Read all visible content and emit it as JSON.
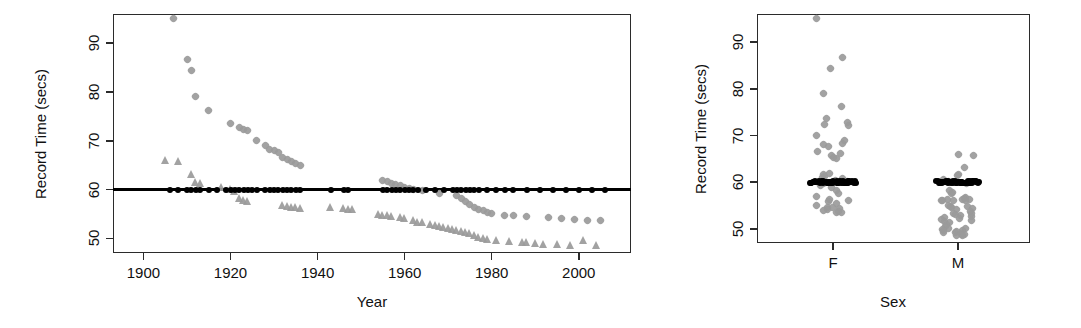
{
  "figure": {
    "background": "#ffffff",
    "female_color": "#9a9a9a",
    "male_color": "#9a9a9a",
    "record_color": "#000000"
  },
  "panels": {
    "left": {
      "name": "record-time-vs-year",
      "ylabel": "Record Time (secs)",
      "xlabel": "Year",
      "yticks": [
        "50",
        "60",
        "70",
        "80",
        "90"
      ],
      "xticks": [
        "1900",
        "1920",
        "1940",
        "1960",
        "1980",
        "2000"
      ]
    },
    "right": {
      "name": "record-time-by-sex",
      "ylabel": "Record Time (secs)",
      "xlabel": "Sex",
      "yticks": [
        "50",
        "60",
        "70",
        "80",
        "90"
      ],
      "xticks": [
        "F",
        "M"
      ]
    }
  },
  "chart_data": [
    {
      "type": "scatter",
      "id": "record-time-vs-year",
      "title": "",
      "xlabel": "Year",
      "ylabel": "Record Time (secs)",
      "xlim": [
        1893,
        2012
      ],
      "ylim": [
        47,
        96
      ],
      "xticks": [
        1900,
        1920,
        1940,
        1960,
        1980,
        2000
      ],
      "yticks": [
        50,
        60,
        70,
        80,
        90
      ],
      "grid": false,
      "legend": null,
      "annotations": [
        {
          "kind": "hline",
          "y": 60,
          "color": "#000000",
          "label": "60 second reference line"
        }
      ],
      "series": [
        {
          "name": "Female record time",
          "marker": "diamond",
          "color": "#9a9a9a",
          "points": [
            [
              1907,
              95.0
            ],
            [
              1910,
              86.6
            ],
            [
              1911,
              84.4
            ],
            [
              1912,
              79.0
            ],
            [
              1915,
              76.2
            ],
            [
              1920,
              73.6
            ],
            [
              1922,
              72.8
            ],
            [
              1923,
              72.4
            ],
            [
              1924,
              72.2
            ],
            [
              1926,
              70.0
            ],
            [
              1928,
              69.0
            ],
            [
              1929,
              68.2
            ],
            [
              1930,
              68.0
            ],
            [
              1931,
              67.6
            ],
            [
              1932,
              66.6
            ],
            [
              1933,
              66.2
            ],
            [
              1934,
              65.8
            ],
            [
              1935,
              65.4
            ],
            [
              1936,
              65.0
            ],
            [
              1955,
              61.8
            ],
            [
              1956,
              61.6
            ],
            [
              1957,
              61.2
            ],
            [
              1958,
              61.0
            ],
            [
              1959,
              60.8
            ],
            [
              1960,
              60.4
            ],
            [
              1961,
              60.2
            ],
            [
              1962,
              60.0
            ],
            [
              1964,
              59.8
            ],
            [
              1968,
              59.2
            ],
            [
              1972,
              58.8
            ],
            [
              1973,
              58.2
            ],
            [
              1974,
              57.6
            ],
            [
              1975,
              57.0
            ],
            [
              1976,
              56.4
            ],
            [
              1977,
              56.0
            ],
            [
              1978,
              55.8
            ],
            [
              1979,
              55.4
            ],
            [
              1980,
              55.0
            ],
            [
              1983,
              54.6
            ],
            [
              1985,
              54.6
            ],
            [
              1988,
              54.4
            ],
            [
              1993,
              54.2
            ],
            [
              1996,
              54.0
            ],
            [
              1999,
              53.8
            ],
            [
              2002,
              53.6
            ],
            [
              2005,
              53.6
            ]
          ]
        },
        {
          "name": "Male record time",
          "marker": "triangle",
          "color": "#9a9a9a",
          "points": [
            [
              1905,
              66.0
            ],
            [
              1908,
              65.8
            ],
            [
              1911,
              63.2
            ],
            [
              1912,
              61.6
            ],
            [
              1913,
              61.4
            ],
            [
              1918,
              60.6
            ],
            [
              1920,
              60.2
            ],
            [
              1921,
              59.8
            ],
            [
              1922,
              58.2
            ],
            [
              1923,
              57.8
            ],
            [
              1924,
              57.6
            ],
            [
              1932,
              56.8
            ],
            [
              1933,
              56.6
            ],
            [
              1934,
              56.4
            ],
            [
              1935,
              56.4
            ],
            [
              1936,
              56.2
            ],
            [
              1943,
              56.4
            ],
            [
              1946,
              56.2
            ],
            [
              1947,
              56.0
            ],
            [
              1948,
              56.0
            ],
            [
              1954,
              55.0
            ],
            [
              1955,
              54.8
            ],
            [
              1956,
              54.8
            ],
            [
              1957,
              54.6
            ],
            [
              1959,
              54.4
            ],
            [
              1960,
              54.2
            ],
            [
              1962,
              53.8
            ],
            [
              1963,
              53.4
            ],
            [
              1964,
              53.4
            ],
            [
              1966,
              53.0
            ],
            [
              1967,
              52.8
            ],
            [
              1968,
              52.6
            ],
            [
              1969,
              52.4
            ],
            [
              1970,
              52.2
            ],
            [
              1971,
              52.0
            ],
            [
              1972,
              51.8
            ],
            [
              1973,
              51.6
            ],
            [
              1974,
              51.4
            ],
            [
              1975,
              51.0
            ],
            [
              1976,
              50.6
            ],
            [
              1977,
              50.2
            ],
            [
              1978,
              50.0
            ],
            [
              1979,
              49.8
            ],
            [
              1981,
              49.6
            ],
            [
              1984,
              49.4
            ],
            [
              1987,
              49.2
            ],
            [
              1988,
              49.2
            ],
            [
              1990,
              49.0
            ],
            [
              1992,
              48.8
            ],
            [
              1995,
              48.8
            ],
            [
              1998,
              48.6
            ],
            [
              2001,
              49.6
            ],
            [
              2004,
              48.6
            ]
          ]
        },
        {
          "name": "Records at 60 seconds",
          "marker": "filled-circle",
          "color": "#000000",
          "points": [
            [
              1906,
              60
            ],
            [
              1908,
              60
            ],
            [
              1910,
              60
            ],
            [
              1911,
              60
            ],
            [
              1912,
              60
            ],
            [
              1913,
              60
            ],
            [
              1915,
              60
            ],
            [
              1917,
              60
            ],
            [
              1919,
              60
            ],
            [
              1920,
              60
            ],
            [
              1921,
              60
            ],
            [
              1922,
              60
            ],
            [
              1923,
              60
            ],
            [
              1924,
              60
            ],
            [
              1925,
              60
            ],
            [
              1926,
              60
            ],
            [
              1928,
              60
            ],
            [
              1929,
              60
            ],
            [
              1930,
              60
            ],
            [
              1931,
              60
            ],
            [
              1932,
              60
            ],
            [
              1933,
              60
            ],
            [
              1934,
              60
            ],
            [
              1935,
              60
            ],
            [
              1936,
              60
            ],
            [
              1943,
              60
            ],
            [
              1946,
              60
            ],
            [
              1947,
              60
            ],
            [
              1955,
              60
            ],
            [
              1956,
              60
            ],
            [
              1957,
              60
            ],
            [
              1958,
              60
            ],
            [
              1959,
              60
            ],
            [
              1960,
              60
            ],
            [
              1961,
              60
            ],
            [
              1962,
              60
            ],
            [
              1963,
              60
            ],
            [
              1965,
              60
            ],
            [
              1967,
              60
            ],
            [
              1969,
              60
            ],
            [
              1971,
              60
            ],
            [
              1972,
              60
            ],
            [
              1973,
              60
            ],
            [
              1974,
              60
            ],
            [
              1975,
              60
            ],
            [
              1976,
              60
            ],
            [
              1977,
              60
            ],
            [
              1979,
              60
            ],
            [
              1981,
              60
            ],
            [
              1983,
              60
            ],
            [
              1985,
              60
            ],
            [
              1988,
              60
            ],
            [
              1991,
              60
            ],
            [
              1994,
              60
            ],
            [
              1997,
              60
            ],
            [
              2000,
              60
            ],
            [
              2003,
              60
            ],
            [
              2006,
              60
            ]
          ]
        }
      ]
    },
    {
      "type": "scatter",
      "id": "record-time-by-sex",
      "title": "",
      "xlabel": "Sex",
      "ylabel": "Record Time (secs)",
      "categories": [
        "F",
        "M"
      ],
      "ylim": [
        47,
        96
      ],
      "yticks": [
        50,
        60,
        70,
        80,
        90
      ],
      "grid": false,
      "legend": null,
      "annotations": [
        {
          "kind": "segment",
          "category": "F",
          "y": 60,
          "color": "#000000",
          "label": "60 second band"
        },
        {
          "kind": "segment",
          "category": "M",
          "y": 60,
          "color": "#000000",
          "label": "60 second band"
        }
      ],
      "series": [
        {
          "name": "F strip",
          "category": "F",
          "marker": "diamond",
          "color": "#9a9a9a",
          "values": [
            95.0,
            86.6,
            84.4,
            79.0,
            76.2,
            73.6,
            72.8,
            72.4,
            72.2,
            70.0,
            69.0,
            68.2,
            68.0,
            67.6,
            66.6,
            66.2,
            65.8,
            65.4,
            65.0,
            61.8,
            61.6,
            61.2,
            61.0,
            60.8,
            60.4,
            60.2,
            60.0,
            59.8,
            59.2,
            58.8,
            58.2,
            57.6,
            57.0,
            56.4,
            56.0,
            55.8,
            55.4,
            55.0,
            54.6,
            54.6,
            54.4,
            54.2,
            54.0,
            53.8,
            53.6,
            53.6
          ]
        },
        {
          "name": "M strip",
          "category": "M",
          "marker": "diamond",
          "color": "#9a9a9a",
          "values": [
            66.0,
            65.8,
            63.2,
            61.6,
            61.4,
            60.6,
            60.2,
            59.8,
            58.2,
            57.8,
            57.6,
            56.8,
            56.6,
            56.4,
            56.4,
            56.2,
            56.4,
            56.2,
            56.0,
            56.0,
            55.0,
            54.8,
            54.8,
            54.6,
            54.4,
            54.2,
            53.8,
            53.4,
            53.4,
            53.0,
            52.8,
            52.6,
            52.4,
            52.2,
            52.0,
            51.8,
            51.6,
            51.4,
            51.0,
            50.6,
            50.2,
            50.0,
            49.8,
            49.6,
            49.4,
            49.2,
            49.2,
            49.0,
            48.8,
            48.8,
            48.6,
            49.6,
            48.6
          ]
        },
        {
          "name": "Records at 60 seconds",
          "marker": "filled-circle",
          "color": "#000000",
          "f_count": 58,
          "m_count": 58,
          "value": 60
        }
      ]
    }
  ]
}
